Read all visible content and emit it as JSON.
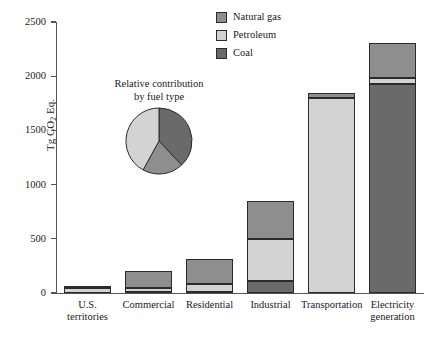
{
  "chart_data": {
    "type": "bar",
    "subtype": "stacked-bar-with-pie-inset",
    "title": "",
    "xlabel": "",
    "ylabel": "Tg CO2 Eq.",
    "ylim": [
      0,
      2500
    ],
    "yticks": [
      0,
      500,
      1000,
      1500,
      2000,
      2500
    ],
    "grid": false,
    "legend_position": "top-center",
    "categories": [
      "U.S. territories",
      "Commercial",
      "Residential",
      "Industrial",
      "Transportation",
      "Electricity generation"
    ],
    "series": [
      {
        "name": "Coal",
        "values": [
          0,
          10,
          5,
          110,
          0,
          1925
        ]
      },
      {
        "name": "Petroleum",
        "values": [
          42,
          40,
          80,
          385,
          1800,
          55
        ]
      },
      {
        "name": "Natural gas",
        "values": [
          5,
          155,
          230,
          350,
          45,
          330
        ]
      }
    ],
    "totals": [
      47,
      205,
      315,
      845,
      1845,
      2310
    ],
    "inset_pie": {
      "type": "pie",
      "title_line1": "Relative contribution",
      "title_line2": "by fuel type",
      "labels": [
        "Coal",
        "Natural gas",
        "Petroleum"
      ],
      "values": [
        38,
        20,
        42
      ]
    }
  },
  "axis": {
    "y_title_prefix": "Tg CO",
    "y_title_sub": "2",
    "y_title_suffix": " Eq.",
    "tick_labels": [
      "2500",
      "2000",
      "1500",
      "1000",
      "500",
      "0"
    ]
  },
  "legend": {
    "items": [
      {
        "label": "Natural gas",
        "color": "#8e8e8e"
      },
      {
        "label": "Petroleum",
        "color": "#d3d3d3"
      },
      {
        "label": "Coal",
        "color": "#6a6a6a"
      }
    ]
  },
  "colors": {
    "natural_gas": "#8e8e8e",
    "petroleum": "#d3d3d3",
    "coal": "#6a6a6a",
    "outline": "#2b2b2b",
    "axis": "#555555"
  },
  "category_labels": [
    {
      "line1": "U.S.",
      "line2": "territories"
    },
    {
      "line1": "Commercial",
      "line2": ""
    },
    {
      "line1": "Residential",
      "line2": ""
    },
    {
      "line1": "Industrial",
      "line2": ""
    },
    {
      "line1": "Transportation",
      "line2": ""
    },
    {
      "line1": "Electricity",
      "line2": "generation"
    }
  ]
}
